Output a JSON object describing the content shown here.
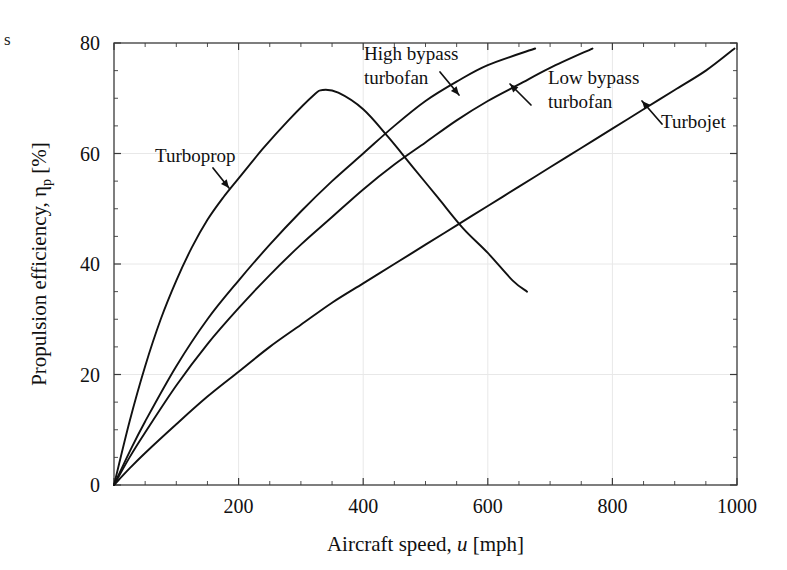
{
  "figure": {
    "page_artifact_text": "s",
    "background_color": "#ffffff",
    "line_color": "#111111",
    "grid_color": "#e8e8e8",
    "axis_color": "#3a3a3a"
  },
  "chart_data": {
    "type": "line",
    "title": "",
    "xlabel": "Aircraft speed, u [mph]",
    "xlabel_parts": {
      "pre": "Aircraft speed, ",
      "symbol": "u",
      "post": " [mph]"
    },
    "ylabel": "Propulsion efficiency, ηp [%]",
    "ylabel_parts": {
      "pre": "Propulsion  efficiency, ",
      "symbol": "η",
      "subscript": "p",
      "post": " [%]"
    },
    "xlim": [
      0,
      1000
    ],
    "ylim": [
      0,
      80
    ],
    "xticks": [
      0,
      200,
      400,
      600,
      800,
      1000
    ],
    "xticklabels": [
      "",
      "200",
      "400",
      "600",
      "800",
      "1000"
    ],
    "yticks": [
      0,
      20,
      40,
      60,
      80
    ],
    "yticklabels": [
      "0",
      "20",
      "40",
      "60",
      "80"
    ],
    "x_minor_tick_step": 50,
    "y_minor_tick_step": 5,
    "grid": true,
    "legend_position": "inline-annotations",
    "series": [
      {
        "name": "Turboprop",
        "x": [
          0,
          25,
          50,
          75,
          100,
          125,
          150,
          175,
          200,
          240,
          280,
          320,
          335,
          360,
          400,
          440,
          480,
          520,
          560,
          600,
          640,
          663
        ],
        "y": [
          0,
          11.5,
          21.5,
          30.0,
          37.0,
          43.0,
          48.0,
          52.0,
          55.5,
          61.0,
          66.0,
          70.5,
          71.5,
          71.0,
          68.0,
          63.0,
          57.5,
          52.0,
          46.5,
          42.0,
          37.0,
          35.0
        ]
      },
      {
        "name": "High bypass turbofan",
        "x": [
          0,
          25,
          50,
          100,
          150,
          200,
          250,
          300,
          350,
          400,
          450,
          500,
          550,
          600,
          676
        ],
        "y": [
          0,
          6.0,
          11.5,
          21.5,
          30.0,
          37.0,
          43.5,
          49.5,
          55.0,
          60.0,
          65.0,
          69.5,
          73.0,
          76.0,
          79.0
        ]
      },
      {
        "name": "Low bypass turbofan",
        "x": [
          0,
          25,
          50,
          100,
          150,
          200,
          250,
          300,
          350,
          400,
          450,
          500,
          550,
          600,
          650,
          700,
          768
        ],
        "y": [
          0,
          5.0,
          9.5,
          18.0,
          25.5,
          32.0,
          38.0,
          43.5,
          48.5,
          53.5,
          58.0,
          62.0,
          66.0,
          69.5,
          72.5,
          75.5,
          79.0
        ]
      },
      {
        "name": "Turbojet",
        "x": [
          0,
          25,
          50,
          100,
          150,
          200,
          250,
          300,
          350,
          400,
          450,
          500,
          550,
          600,
          650,
          700,
          750,
          800,
          850,
          900,
          950,
          996
        ],
        "y": [
          0,
          3.0,
          5.8,
          11.0,
          16.0,
          20.5,
          25.0,
          29.0,
          33.0,
          36.5,
          40.0,
          43.5,
          47.0,
          50.5,
          54.0,
          57.5,
          61.0,
          64.5,
          68.0,
          71.5,
          75.0,
          79.0
        ]
      }
    ],
    "annotations": [
      {
        "id": "turboprop",
        "label": "Turboprop",
        "lines": [
          "Turboprop"
        ],
        "text_x": 155,
        "text_y": 162,
        "arrow_from": [
          213,
          168
        ],
        "arrow_to": [
          229,
          188
        ]
      },
      {
        "id": "high-bypass-turbofan",
        "label": "High bypass turbofan",
        "lines": [
          "High bypass",
          "turbofan"
        ],
        "text_x": 364,
        "text_y": 60,
        "arrow_from": [
          440,
          72
        ],
        "arrow_to": [
          459,
          95
        ]
      },
      {
        "id": "low-bypass-turbofan",
        "label": "Low bypass turbofan",
        "lines": [
          "Low bypass",
          "turbofan"
        ],
        "text_x": 548,
        "text_y": 84,
        "arrow_from": [
          531,
          105
        ],
        "arrow_to": [
          510,
          84
        ]
      },
      {
        "id": "turbojet",
        "label": "Turbojet",
        "lines": [
          "Turbojet"
        ],
        "text_x": 661,
        "text_y": 128,
        "arrow_from": [
          662,
          124
        ],
        "arrow_to": [
          642,
          101
        ]
      }
    ]
  },
  "plot_box": {
    "left": 114,
    "right": 737,
    "top": 43,
    "bottom": 485
  }
}
